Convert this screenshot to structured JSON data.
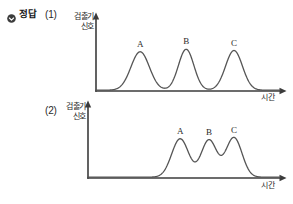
{
  "header": {
    "icon": "check-circle-icon",
    "label": "정답"
  },
  "figures": [
    {
      "index_label": "(1)",
      "y_axis_label_line1": "검출기",
      "y_axis_label_line2": "신호",
      "x_axis_label": "시간",
      "peak_labels": [
        "A",
        "B",
        "C"
      ]
    },
    {
      "index_label": "(2)",
      "y_axis_label_line1": "검출기",
      "y_axis_label_line2": "신호",
      "x_axis_label": "시간",
      "peak_labels": [
        "A",
        "B",
        "C"
      ]
    }
  ],
  "colors": {
    "axis": "#3b3b3b",
    "trace": "#555555",
    "text": "#2a2a2a",
    "background": "#ffffff"
  },
  "chart_data": [
    {
      "type": "line",
      "title": "(1) 검출기 신호 vs 시간",
      "xlabel": "시간",
      "ylabel": "검출기 신호",
      "xlim": [
        0,
        100
      ],
      "ylim": [
        0,
        100
      ],
      "grid": false,
      "legend": "none",
      "annotations": [
        "A",
        "B",
        "C"
      ],
      "series": [
        {
          "name": "chromatogram",
          "peaks": [
            {
              "label": "A",
              "center": 24,
              "height": 62,
              "width": 5.0
            },
            {
              "label": "B",
              "center": 49,
              "height": 66,
              "width": 4.2
            },
            {
              "label": "C",
              "center": 75,
              "height": 64,
              "width": 4.6
            }
          ]
        }
      ]
    },
    {
      "type": "line",
      "title": "(2) 검출기 신호 vs 시간",
      "xlabel": "시간",
      "ylabel": "검출기 신호",
      "xlim": [
        0,
        100
      ],
      "ylim": [
        0,
        100
      ],
      "grid": false,
      "legend": "none",
      "annotations": [
        "A",
        "B",
        "C"
      ],
      "series": [
        {
          "name": "chromatogram",
          "peaks": [
            {
              "label": "A",
              "center": 48,
              "height": 62,
              "width": 4.4
            },
            {
              "label": "B",
              "center": 63,
              "height": 60,
              "width": 4.0
            },
            {
              "label": "C",
              "center": 76,
              "height": 64,
              "width": 4.2
            }
          ]
        }
      ]
    }
  ]
}
